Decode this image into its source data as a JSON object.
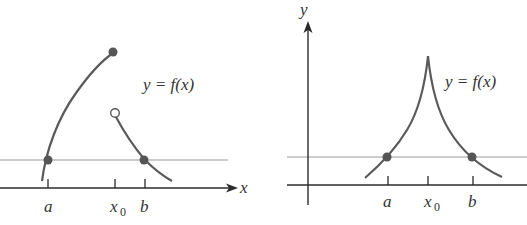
{
  "colors": {
    "curve": "#5a5a5a",
    "axis": "#2b2b2b",
    "reference_line": "#bdbdbd",
    "point_fill": "#555555",
    "open_point_fill": "#ffffff",
    "text": "#333333"
  },
  "left_panel": {
    "x_axis_label": "x",
    "function_label": "y = f(x)",
    "ticks": [
      {
        "label": "a",
        "subscript": ""
      },
      {
        "label": "x",
        "subscript": "0"
      },
      {
        "label": "b",
        "subscript": ""
      }
    ],
    "points": [
      {
        "name": "a-intersection",
        "type": "filled"
      },
      {
        "name": "left-branch-endpoint",
        "type": "filled"
      },
      {
        "name": "right-branch-start",
        "type": "open"
      },
      {
        "name": "b-intersection",
        "type": "filled"
      }
    ]
  },
  "right_panel": {
    "y_axis_label": "y",
    "function_label": "y = f(x)",
    "ticks": [
      {
        "label": "a",
        "subscript": ""
      },
      {
        "label": "x",
        "subscript": "0"
      },
      {
        "label": "b",
        "subscript": ""
      }
    ],
    "points": [
      {
        "name": "a-intersection",
        "type": "filled"
      },
      {
        "name": "b-intersection",
        "type": "filled"
      }
    ]
  }
}
